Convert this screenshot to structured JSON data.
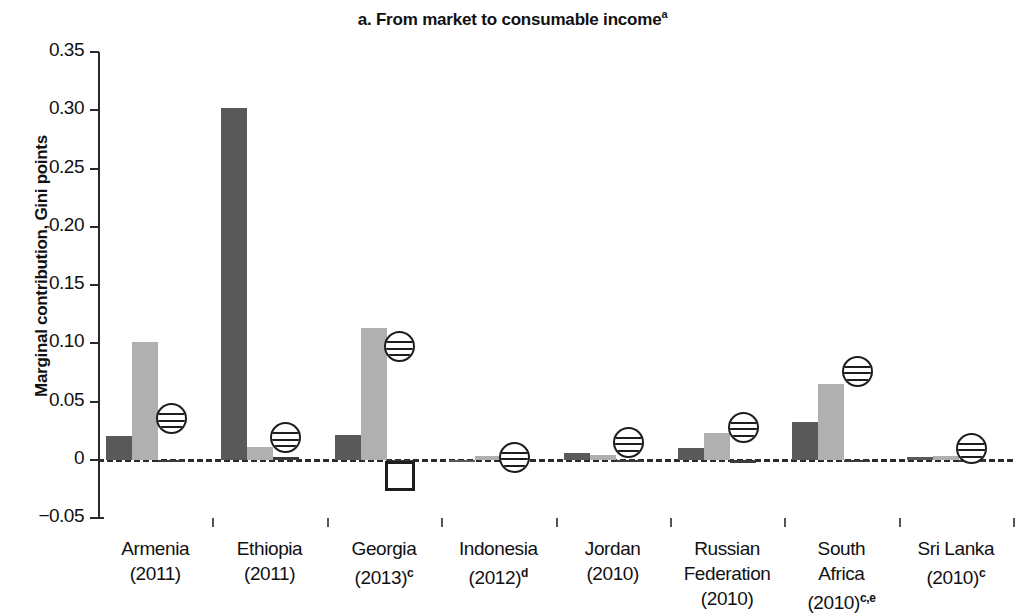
{
  "chart_data": {
    "type": "bar",
    "title": "a. From market to consumable income",
    "title_superscript": "a",
    "ylabel": "Marginal contribution, Gini points",
    "xlabel": "",
    "ylim": [
      -0.05,
      0.35
    ],
    "ytick_labels": [
      "0.35",
      "0.30",
      "0.25",
      "0.20",
      "0.15",
      "0.10",
      "0.05",
      "0",
      "−0.05"
    ],
    "ytick_values": [
      0.35,
      0.3,
      0.25,
      0.2,
      0.15,
      0.1,
      0.05,
      0,
      -0.05
    ],
    "grid": false,
    "legend_position": "none",
    "zero_line": "dashed",
    "categories": [
      "Armenia (2011)",
      "Ethiopia (2011)",
      "Georgia (2013)",
      "Indonesia (2012)",
      "Jordan (2010)",
      "Russian Federation (2010)",
      "South Africa (2010)",
      "Sri Lanka (2010)"
    ],
    "category_labels": [
      {
        "name": "Armenia",
        "year": "(2011)",
        "sup": "",
        "lines": 2
      },
      {
        "name": "Ethiopia",
        "year": "(2011)",
        "sup": "",
        "lines": 2
      },
      {
        "name": "Georgia",
        "year": "(2013)",
        "sup": "c",
        "lines": 2
      },
      {
        "name": "Indonesia",
        "year": "(2012)",
        "sup": "d",
        "lines": 2
      },
      {
        "name": "Jordan",
        "year": "(2010)",
        "sup": "",
        "lines": 2
      },
      {
        "name": "Russian",
        "name2": "Federation",
        "year": "(2010)",
        "sup": "",
        "lines": 3
      },
      {
        "name": "South",
        "name2": "Africa",
        "year": "(2010)",
        "sup": "c,e",
        "lines": 3
      },
      {
        "name": "Sri Lanka",
        "year": "(2010)",
        "sup": "c",
        "lines": 2
      }
    ],
    "series": [
      {
        "name": "bar-dark",
        "color": "#595959",
        "values": [
          0.02,
          0.302,
          0.021,
          0.0,
          0.006,
          0.01,
          0.032,
          0.002
        ]
      },
      {
        "name": "bar-light",
        "color": "#b0b0b0",
        "values": [
          0.101,
          0.011,
          0.113,
          0.003,
          0.004,
          0.023,
          0.065,
          0.003
        ]
      },
      {
        "name": "bar-thin-dark",
        "color": "#3a3a3a",
        "values": [
          -0.001,
          0.002,
          -0.001,
          -0.003,
          -0.001,
          -0.003,
          0.0,
          0.0
        ]
      }
    ],
    "markers": [
      {
        "shape": "circle-striped",
        "values": [
          0.035,
          0.019,
          0.097,
          0.002,
          0.015,
          0.028,
          0.076,
          0.01
        ]
      },
      {
        "shape": "square-open",
        "values": [
          null,
          null,
          -0.014,
          null,
          null,
          null,
          null,
          null
        ]
      }
    ]
  },
  "colors": {
    "dark_bar": "#595959",
    "light_bar": "#b0b0b0",
    "thin_bar": "#3a3a3a",
    "axis": "#2a2a2a",
    "text": "#111111",
    "background": "#ffffff"
  }
}
